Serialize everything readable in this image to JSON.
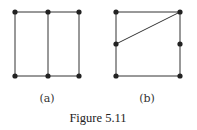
{
  "figure": {
    "caption": "Figure 5.11",
    "colors": {
      "edge": "#333333",
      "node": "#222222"
    },
    "graphs": [
      {
        "label": "(a)",
        "nodes": [
          [
            15,
            12
          ],
          [
            48,
            12
          ],
          [
            79,
            12
          ],
          [
            15,
            76
          ],
          [
            48,
            76
          ],
          [
            79,
            76
          ]
        ],
        "edges": [
          [
            0,
            1
          ],
          [
            1,
            2
          ],
          [
            3,
            4
          ],
          [
            4,
            5
          ],
          [
            0,
            3
          ],
          [
            1,
            4
          ],
          [
            2,
            5
          ]
        ]
      },
      {
        "label": "(b)",
        "nodes": [
          [
            116,
            12
          ],
          [
            180,
            12
          ],
          [
            116,
            44
          ],
          [
            180,
            44
          ],
          [
            116,
            76
          ],
          [
            180,
            76
          ]
        ],
        "edges": [
          [
            0,
            1
          ],
          [
            4,
            5
          ],
          [
            0,
            2
          ],
          [
            2,
            4
          ],
          [
            1,
            3
          ],
          [
            3,
            5
          ],
          [
            2,
            1
          ]
        ]
      }
    ]
  }
}
